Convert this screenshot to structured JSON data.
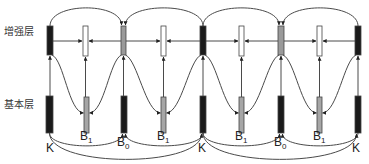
{
  "diagram": {
    "type": "hierarchical-prediction-structure",
    "layers": {
      "enhancement": {
        "label": "增强层",
        "y": 31
      },
      "base": {
        "label": "基本层",
        "y": 104
      }
    },
    "colors": {
      "key": "#1a1a1a",
      "b0": "#1a1a1a",
      "b1_enh": "#999999",
      "b1_base": "#a6a6a6",
      "enh_b0": "#9a9a9a",
      "white": "#ffffff",
      "line": "#4a4a4a",
      "outline": "#444444"
    },
    "enhancement_frames": [
      {
        "x": 47,
        "w": 6,
        "y": 26,
        "h": 29,
        "fill": "#1a1a1a"
      },
      {
        "x": 83,
        "w": 5,
        "y": 26,
        "h": 30,
        "fill": "#ffffff"
      },
      {
        "x": 121,
        "w": 5,
        "y": 26,
        "h": 29,
        "fill": "#9a9a9a"
      },
      {
        "x": 161,
        "w": 5,
        "y": 26,
        "h": 30,
        "fill": "#ffffff"
      },
      {
        "x": 200,
        "w": 6,
        "y": 26,
        "h": 29,
        "fill": "#1a1a1a"
      },
      {
        "x": 239,
        "w": 5,
        "y": 26,
        "h": 30,
        "fill": "#ffffff"
      },
      {
        "x": 278,
        "w": 6,
        "y": 26,
        "h": 29,
        "fill": "#9a9a9a"
      },
      {
        "x": 317,
        "w": 5,
        "y": 26,
        "h": 30,
        "fill": "#ffffff"
      },
      {
        "x": 355,
        "w": 6,
        "y": 26,
        "h": 29,
        "fill": "#1a1a1a"
      }
    ],
    "base_frames": [
      {
        "x": 46,
        "w": 7,
        "y": 96,
        "h": 37,
        "fill": "#1a1a1a",
        "label": "K",
        "label_x": 46,
        "label_y": 152
      },
      {
        "x": 84,
        "w": 5,
        "y": 97,
        "h": 36,
        "fill": "#a6a6a6",
        "label": "B",
        "sub": "1",
        "label_x": 80,
        "label_y": 140
      },
      {
        "x": 121,
        "w": 6,
        "y": 96,
        "h": 37,
        "fill": "#1a1a1a",
        "label": "B",
        "sub": "0",
        "label_x": 117,
        "label_y": 146
      },
      {
        "x": 161,
        "w": 5,
        "y": 97,
        "h": 36,
        "fill": "#a6a6a6",
        "label": "B",
        "sub": "1",
        "label_x": 157,
        "label_y": 140
      },
      {
        "x": 200,
        "w": 6,
        "y": 96,
        "h": 37,
        "fill": "#1a1a1a",
        "label": "K",
        "label_x": 198,
        "label_y": 152
      },
      {
        "x": 239,
        "w": 5,
        "y": 97,
        "h": 36,
        "fill": "#a6a6a6",
        "label": "B",
        "sub": "1",
        "label_x": 235,
        "label_y": 140
      },
      {
        "x": 278,
        "w": 6,
        "y": 96,
        "h": 37,
        "fill": "#1a1a1a",
        "label": "B",
        "sub": "0",
        "label_x": 274,
        "label_y": 146
      },
      {
        "x": 317,
        "w": 5,
        "y": 97,
        "h": 36,
        "fill": "#a6a6a6",
        "label": "B",
        "sub": "1",
        "label_x": 313,
        "label_y": 140
      },
      {
        "x": 355,
        "w": 6,
        "y": 96,
        "h": 37,
        "fill": "#1a1a1a",
        "label": "K",
        "label_x": 352,
        "label_y": 152
      }
    ],
    "labels": {
      "enhancement_layer": "增强层",
      "base_layer": "基本层",
      "key_frame": "K",
      "b0_frame": "B",
      "b0_sub": "0",
      "b1_frame": "B",
      "b1_sub": "1"
    }
  }
}
